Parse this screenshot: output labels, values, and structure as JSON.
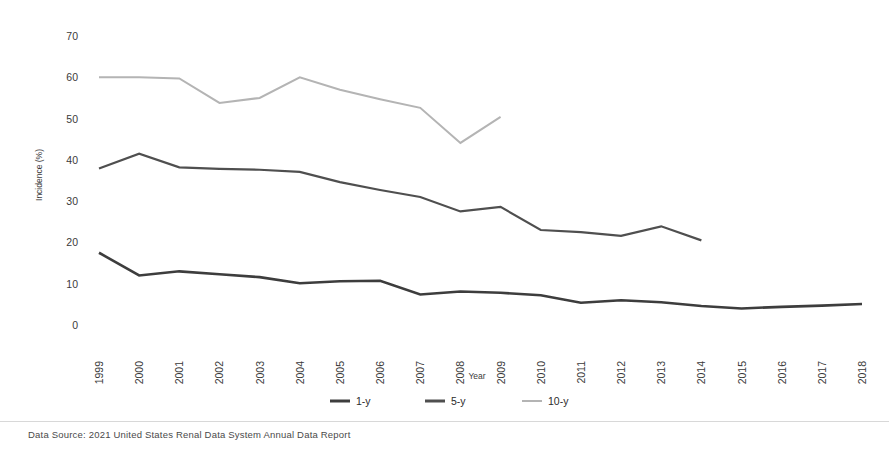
{
  "chart_data": {
    "type": "line",
    "title": "",
    "subtitle": "",
    "xlabel": "Year",
    "ylabel": "Incidence (%)",
    "x": [
      1999,
      2000,
      2001,
      2002,
      2003,
      2004,
      2005,
      2006,
      2007,
      2008,
      2009,
      2010,
      2011,
      2012,
      2013,
      2014,
      2015,
      2016,
      2017,
      2018
    ],
    "categories": [
      "1999",
      "2000",
      "2001",
      "2002",
      "2003",
      "2004",
      "2005",
      "2006",
      "2007",
      "2008",
      "2009",
      "2010",
      "2011",
      "2012",
      "2013",
      "2014",
      "2015",
      "2016",
      "2017",
      "2018"
    ],
    "xlim": [
      1999,
      2018
    ],
    "ylim": [
      0,
      70
    ],
    "yticks": [
      0,
      10,
      20,
      30,
      40,
      50,
      60,
      70
    ],
    "ytick_labels": [
      "0",
      "10",
      "20",
      "30",
      "40",
      "50",
      "60",
      "70"
    ],
    "grid": false,
    "legend_position": "bottom-center",
    "series": [
      {
        "name": "1-y",
        "color": "#3d3d3d",
        "stroke_width": 2.6,
        "values": [
          17.5,
          12.0,
          13.0,
          12.3,
          11.6,
          10.1,
          10.6,
          10.7,
          7.4,
          8.1,
          7.8,
          7.2,
          5.4,
          6.0,
          5.5,
          4.6,
          4.0,
          4.4,
          4.7,
          5.1
        ]
      },
      {
        "name": "5-y",
        "color": "#4f4f4f",
        "stroke_width": 2.2,
        "values": [
          37.9,
          41.5,
          38.2,
          37.8,
          37.6,
          37.1,
          34.6,
          32.7,
          31.0,
          27.5,
          28.6,
          23.0,
          22.5,
          21.6,
          23.9,
          20.5,
          null,
          null,
          null,
          null
        ]
      },
      {
        "name": "10-y",
        "color": "#b4b4b4",
        "stroke_width": 2.0,
        "values": [
          60.0,
          60.0,
          59.7,
          53.8,
          55.0,
          60.0,
          57.0,
          54.7,
          52.6,
          44.1,
          50.4,
          null,
          null,
          null,
          null,
          null,
          null,
          null,
          null,
          null
        ]
      }
    ]
  },
  "legend": {
    "items": [
      {
        "label": "1-y",
        "color": "#3d3d3d"
      },
      {
        "label": "5-y",
        "color": "#4f4f4f"
      },
      {
        "label": "10-y",
        "color": "#b4b4b4"
      }
    ]
  },
  "axes": {
    "y_title": "Incidence (%)",
    "x_title": "Year"
  },
  "footer": {
    "source": "Data Source: 2021 United States Renal Data System Annual Data Report"
  }
}
